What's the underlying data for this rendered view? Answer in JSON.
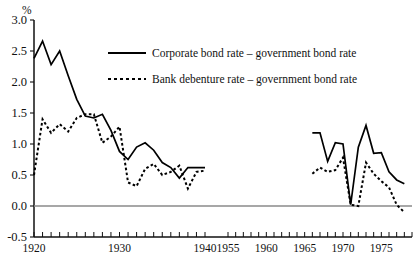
{
  "chart_data": {
    "type": "line",
    "title": "",
    "subtitle": "",
    "xlabel": "",
    "ylabel": "",
    "unit_label": "%",
    "ylim": [
      -0.5,
      3.0
    ],
    "yticks": [
      3.0,
      2.5,
      2.0,
      1.5,
      1.0,
      0.5,
      0.0,
      -0.5
    ],
    "ytick_labels": [
      "3.0",
      "2.5",
      "2.0",
      "1.5",
      "1.0",
      "0.5",
      "0.0",
      "-0.5"
    ],
    "xtick_labels": [
      "1920",
      "1930",
      "1940",
      "1955",
      "1960",
      "1965",
      "1970",
      "1975"
    ],
    "xtick_values": [
      1920,
      1930,
      1940,
      1955,
      1960,
      1965,
      1970,
      1975
    ],
    "axis_break": true,
    "axis_break_between": [
      1940,
      1955
    ],
    "grid": false,
    "zero_line": true,
    "legend_position": "top-center",
    "legend": [
      "Corporate bond rate – government bond rate",
      "Bank debenture rate – government bond rate"
    ],
    "series": [
      {
        "name": "Corporate bond rate – government bond rate",
        "style": "solid",
        "segments": [
          {
            "x": [
              1920,
              1921,
              1922,
              1923,
              1924,
              1925,
              1926,
              1927,
              1928,
              1929,
              1930,
              1931,
              1932,
              1933,
              1934,
              1935,
              1936,
              1937,
              1938,
              1939,
              1940
            ],
            "y": [
              2.38,
              2.66,
              2.28,
              2.5,
              2.1,
              1.72,
              1.45,
              1.42,
              1.48,
              1.22,
              0.88,
              0.75,
              0.95,
              1.02,
              0.9,
              0.7,
              0.62,
              0.45,
              0.62,
              0.62,
              0.62
            ]
          },
          {
            "x": [
              1966,
              1967,
              1968,
              1969,
              1970,
              1971,
              1972,
              1973,
              1974,
              1975,
              1976,
              1977,
              1978
            ],
            "y": [
              1.18,
              1.18,
              0.72,
              1.02,
              1.0,
              0.02,
              0.95,
              1.3,
              0.85,
              0.86,
              0.55,
              0.42,
              0.36
            ]
          }
        ]
      },
      {
        "name": "Bank debenture rate – government bond rate",
        "style": "dashed",
        "segments": [
          {
            "x": [
              1920,
              1921,
              1922,
              1923,
              1924,
              1925,
              1926,
              1927,
              1928,
              1929,
              1930,
              1931,
              1932,
              1933,
              1934,
              1935,
              1936,
              1937,
              1938,
              1939,
              1940
            ],
            "y": [
              0.5,
              1.4,
              1.18,
              1.32,
              1.2,
              1.42,
              1.48,
              1.48,
              1.02,
              1.12,
              1.28,
              0.38,
              0.32,
              0.6,
              0.68,
              0.5,
              0.55,
              0.65,
              0.28,
              0.55,
              0.57
            ]
          },
          {
            "x": [
              1966,
              1967,
              1968,
              1969,
              1970,
              1971,
              1972,
              1973,
              1974,
              1975,
              1976,
              1977,
              1978
            ],
            "y": [
              0.52,
              0.62,
              0.55,
              0.58,
              0.78,
              0.02,
              0.0,
              0.7,
              0.52,
              0.4,
              0.3,
              0.02,
              -0.1
            ]
          }
        ]
      }
    ]
  },
  "layout": {
    "plot_left": 34,
    "plot_right": 412,
    "plot_top": 20,
    "plot_bottom": 237,
    "break_x_pixel": 205,
    "resume_x_pixel": 228
  }
}
